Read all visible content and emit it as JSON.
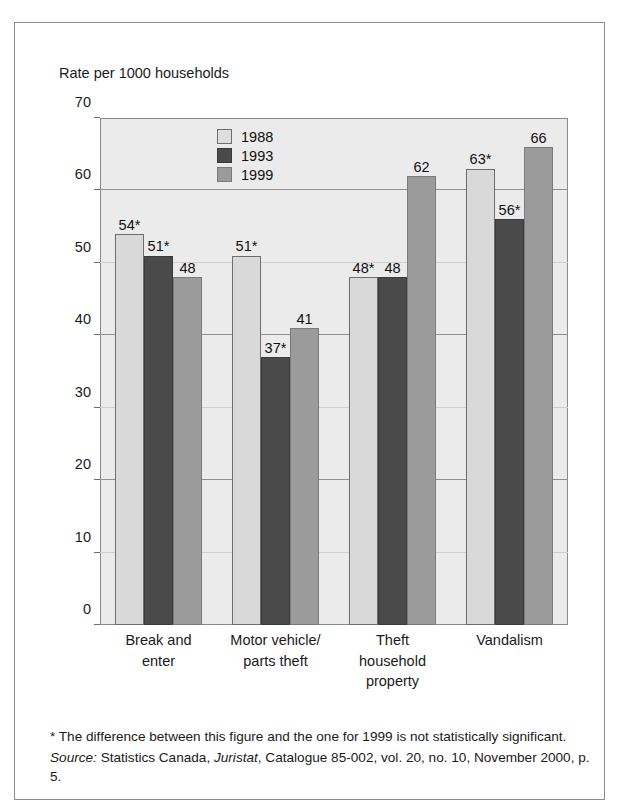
{
  "figure": {
    "y_axis_title": "Rate per 1000 households"
  },
  "legend": {
    "entries": [
      {
        "label": "1988",
        "key": "y1988",
        "color": "#d9d9d9"
      },
      {
        "label": "1993",
        "key": "y1993",
        "color": "#4a4a4a"
      },
      {
        "label": "1999",
        "key": "y1999",
        "color": "#9b9b9b"
      }
    ]
  },
  "footnote": {
    "asterisk_note": "* The difference between this figure and the one for 1999 is not statistically significant.",
    "source_label": "Source:",
    "source_part1": " Statistics Canada, ",
    "source_italic": "Juristat",
    "source_part2": ", Catalogue 85-002, vol. 20, no. 10, November 2000, p. 5."
  },
  "chart_data": {
    "type": "bar",
    "title": "",
    "subtitle": "",
    "xlabel": "",
    "ylabel": "Rate per 1000 households",
    "ylim": [
      0,
      70
    ],
    "yticks": [
      0,
      10,
      20,
      30,
      40,
      50,
      60,
      70
    ],
    "ytick_labels": [
      "0",
      "10",
      "20",
      "30",
      "40",
      "50",
      "60",
      "70"
    ],
    "grid": true,
    "legend_position": "top-center-inside",
    "categories": [
      "Break and\nenter",
      "Motor vehicle/\nparts theft",
      "Theft\nhousehold\nproperty",
      "Vandalism"
    ],
    "category_lines": [
      [
        "Break and",
        "enter"
      ],
      [
        "Motor vehicle/",
        "parts theft"
      ],
      [
        "Theft",
        "household",
        "property"
      ],
      [
        "Vandalism"
      ]
    ],
    "series": [
      {
        "name": "1988",
        "key": "y1988",
        "color": "#d9d9d9",
        "values": [
          54,
          51,
          48,
          63
        ],
        "labels": [
          "54*",
          "51*",
          "48*",
          "63*"
        ]
      },
      {
        "name": "1993",
        "key": "y1993",
        "color": "#4a4a4a",
        "values": [
          51,
          37,
          48,
          56
        ],
        "labels": [
          "51*",
          "37*",
          "48",
          "56*"
        ]
      },
      {
        "name": "1999",
        "key": "y1999",
        "color": "#9b9b9b",
        "values": [
          48,
          41,
          62,
          66
        ],
        "labels": [
          "48",
          "41",
          "62",
          "66"
        ]
      }
    ],
    "annotations": [
      "* marks figures not statistically different from the 1999 figure"
    ]
  }
}
